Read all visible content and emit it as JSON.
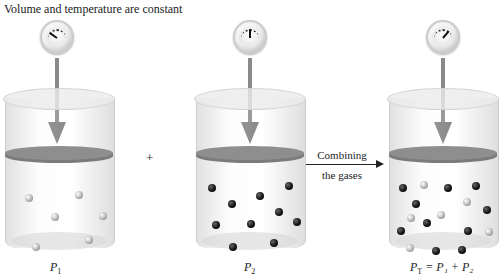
{
  "title": "Volume and temperature are constant",
  "operator_plus": "+",
  "process_arrow": {
    "line1": "Combining",
    "line2": "the gases"
  },
  "panels": [
    {
      "id": "gas1",
      "label_var": "P",
      "label_sub": "1",
      "label_rest": "",
      "gauge_reading": "low",
      "molecules": {
        "light": 6,
        "dark": 0
      }
    },
    {
      "id": "gas2",
      "label_var": "P",
      "label_sub": "2",
      "label_rest": "",
      "gauge_reading": "medium",
      "molecules": {
        "light": 0,
        "dark": 10
      }
    },
    {
      "id": "mixture",
      "label_var": "P",
      "label_sub": "T",
      "label_rest": " = P₁ + P₂",
      "gauge_reading": "high",
      "molecules": {
        "light": 6,
        "dark": 10
      }
    }
  ],
  "colors": {
    "piston": "#8e8e8e",
    "arrow": "#7a7a7a",
    "light_molecule": "#b5b5b5",
    "dark_molecule": "#151515"
  }
}
